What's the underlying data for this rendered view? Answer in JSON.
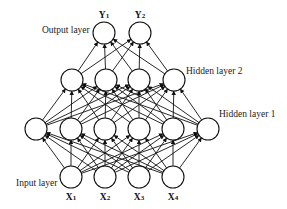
{
  "diagram": {
    "type": "feedforward-neural-network",
    "colors": {
      "stroke": "#111111",
      "background": "#ffffff",
      "text": "#222222"
    },
    "node_radius": 11,
    "layers": [
      {
        "id": "input",
        "label": "Input layer",
        "label_pos": [
          16,
          186
        ],
        "y": 177,
        "nodes": [
          {
            "x": 71,
            "label": "X",
            "sub": "1"
          },
          {
            "x": 105,
            "label": "X",
            "sub": "2"
          },
          {
            "x": 139,
            "label": "X",
            "sub": "3"
          },
          {
            "x": 173,
            "label": "X",
            "sub": "4"
          }
        ],
        "node_label_y": 200
      },
      {
        "id": "hidden1",
        "label": "Hidden layer 1",
        "label_pos": [
          219,
          117
        ],
        "y": 129,
        "nodes": [
          {
            "x": 36
          },
          {
            "x": 71
          },
          {
            "x": 105
          },
          {
            "x": 139
          },
          {
            "x": 173
          },
          {
            "x": 208
          }
        ]
      },
      {
        "id": "hidden2",
        "label": "Hidden layer 2",
        "label_pos": [
          186,
          74
        ],
        "y": 80,
        "nodes": [
          {
            "x": 72
          },
          {
            "x": 106
          },
          {
            "x": 139
          },
          {
            "x": 174
          }
        ]
      },
      {
        "id": "output",
        "label": "Output layer",
        "label_pos": [
          42,
          33
        ],
        "y": 33,
        "nodes": [
          {
            "x": 104,
            "label": "Y",
            "sub": "1"
          },
          {
            "x": 140,
            "label": "Y",
            "sub": "2"
          }
        ],
        "node_label_y": 18
      }
    ],
    "connections": "fully-connected, arrows pointing upward from each layer to the next"
  }
}
